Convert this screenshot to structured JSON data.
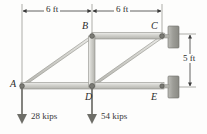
{
  "figure": {
    "type": "truss-free-body-diagram",
    "title": "",
    "colors": {
      "member_fill": "#c9c9c4",
      "member_edge": "#8e8e88",
      "wall_fill": "#a9a9a4",
      "line": "#3a3a3a",
      "text": "#2b2b2b",
      "background": "#fdfdfc"
    }
  },
  "joints": [
    {
      "id": "A",
      "label": "A",
      "x": 22,
      "y": 86
    },
    {
      "id": "B",
      "label": "B",
      "x": 92,
      "y": 36
    },
    {
      "id": "C",
      "label": "C",
      "x": 162,
      "y": 36
    },
    {
      "id": "D",
      "label": "D",
      "x": 92,
      "y": 86
    },
    {
      "id": "E",
      "label": "E",
      "x": 162,
      "y": 86
    }
  ],
  "joint_labels": [
    {
      "label": "A",
      "x": 10,
      "y": 80
    },
    {
      "label": "B",
      "x": 83,
      "y": 23
    },
    {
      "label": "C",
      "x": 152,
      "y": 23
    },
    {
      "label": "D",
      "x": 86,
      "y": 92
    },
    {
      "label": "E",
      "x": 152,
      "y": 92
    }
  ],
  "members": [
    {
      "from": "A",
      "to": "B"
    },
    {
      "from": "A",
      "to": "D"
    },
    {
      "from": "B",
      "to": "C"
    },
    {
      "from": "B",
      "to": "D"
    },
    {
      "from": "D",
      "to": "C"
    },
    {
      "from": "D",
      "to": "E"
    }
  ],
  "supports": [
    {
      "at": "C",
      "type": "wall-pin",
      "x": 168,
      "y": 36
    },
    {
      "at": "E",
      "type": "wall-pin",
      "x": 168,
      "y": 86
    }
  ],
  "dimensions": [
    {
      "id": "span-ad",
      "label": "6 ft",
      "orientation": "horizontal",
      "label_x": 43,
      "label_y": 7
    },
    {
      "id": "span-de",
      "label": "6 ft",
      "orientation": "horizontal",
      "label_x": 114,
      "label_y": 7
    },
    {
      "id": "height-ce",
      "label": "5 ft",
      "orientation": "vertical",
      "label_x": 186,
      "label_y": 56
    }
  ],
  "loads": [
    {
      "at": "A",
      "label": "28 kips",
      "direction": "down",
      "label_x": 33,
      "label_y": 114
    },
    {
      "at": "D",
      "label": "54 kips",
      "direction": "down",
      "label_x": 103,
      "label_y": 114
    }
  ]
}
